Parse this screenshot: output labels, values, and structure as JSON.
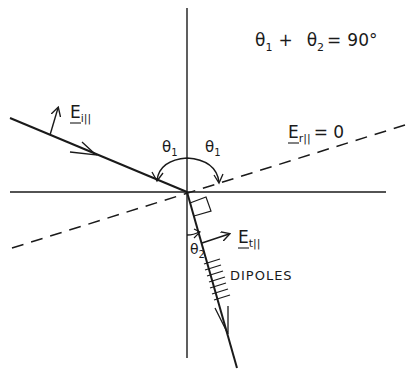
{
  "diagram": {
    "equation": {
      "theta1": "θ",
      "sub1": "1",
      "plus": "+",
      "theta2": "θ",
      "sub2": "2",
      "equals": "=",
      "value": "90°"
    },
    "labels": {
      "incident_field": {
        "main": "E",
        "sub": "i||"
      },
      "reflected_field": {
        "main": "E",
        "sub": "r||",
        "eq": "= 0"
      },
      "transmitted_field": {
        "main": "E",
        "sub": "t||"
      },
      "angle_incident": {
        "main": "θ",
        "sub": "1"
      },
      "angle_reflected": {
        "main": "θ",
        "sub": "1"
      },
      "angle_transmitted": {
        "main": "θ",
        "sub": "2"
      },
      "dipoles": "DIPOLES"
    },
    "colors": {
      "ink": "#1a1a1a",
      "background": "#ffffff"
    }
  }
}
